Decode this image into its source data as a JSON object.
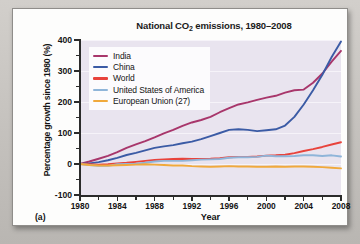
{
  "figure": {
    "panel_label": "(a)"
  },
  "chart_data": {
    "type": "line",
    "title": "National CO2 emissions, 1980–2008",
    "title_prefix": "National CO",
    "title_subscript": "2",
    "title_suffix": " emissions, 1980–2008",
    "xlabel": "Year",
    "ylabel": "Percentage growth since 1980 (%)",
    "xlim": [
      1980,
      2008
    ],
    "ylim": [
      -100,
      400
    ],
    "xticks": [
      1980,
      1984,
      1988,
      1992,
      1996,
      2000,
      2004,
      2008
    ],
    "xtick_labels": [
      "1980",
      "1984",
      "1988",
      "1992",
      "1996",
      "2000",
      "2004",
      "2008"
    ],
    "xticks_minor": [
      1982,
      1986,
      1990,
      1994,
      1998,
      2002,
      2006
    ],
    "yticks": [
      -100,
      0,
      100,
      200,
      300,
      400
    ],
    "ytick_labels": [
      "-100",
      "0",
      "100",
      "200",
      "300",
      "400"
    ],
    "yticks_minor": [
      -50,
      50,
      150,
      250,
      350
    ],
    "grid": true,
    "grid_axis": "y",
    "legend_position": "upper-left",
    "plot_background": "#e9e4ef",
    "x": [
      1980,
      1981,
      1982,
      1983,
      1984,
      1985,
      1986,
      1987,
      1988,
      1989,
      1990,
      1991,
      1992,
      1993,
      1994,
      1995,
      1996,
      1997,
      1998,
      1999,
      2000,
      2001,
      2002,
      2003,
      2004,
      2005,
      2006,
      2007,
      2008
    ],
    "series": [
      {
        "name": "India",
        "color": "#a8366b",
        "values": [
          0,
          8,
          17,
          26,
          38,
          52,
          63,
          74,
          86,
          99,
          110,
          123,
          134,
          142,
          152,
          167,
          180,
          192,
          199,
          207,
          214,
          220,
          230,
          238,
          240,
          262,
          292,
          330,
          365
        ]
      },
      {
        "name": "China",
        "color": "#3b5ba5",
        "values": [
          0,
          2,
          6,
          12,
          20,
          29,
          36,
          44,
          52,
          57,
          61,
          67,
          72,
          80,
          90,
          100,
          110,
          112,
          110,
          106,
          109,
          112,
          124,
          152,
          192,
          238,
          288,
          345,
          395
        ]
      },
      {
        "name": "World",
        "color": "#e8433c",
        "values": [
          0,
          -1,
          -2,
          -1,
          2,
          4,
          7,
          10,
          13,
          15,
          16,
          17,
          16,
          16,
          17,
          19,
          22,
          23,
          23,
          24,
          27,
          28,
          30,
          35,
          42,
          48,
          55,
          63,
          70
        ]
      },
      {
        "name": "United States of America",
        "color": "#8fb5d9",
        "values": [
          0,
          -3,
          -6,
          -6,
          -1,
          0,
          1,
          4,
          8,
          10,
          10,
          10,
          12,
          14,
          15,
          16,
          20,
          22,
          22,
          23,
          27,
          25,
          25,
          26,
          28,
          28,
          26,
          28,
          24
        ]
      },
      {
        "name": "European Union (27)",
        "color": "#f0a93c",
        "values": [
          0,
          -3,
          -5,
          -5,
          -4,
          -3,
          -2,
          -1,
          -2,
          -3,
          -5,
          -5,
          -7,
          -8,
          -9,
          -8,
          -7,
          -8,
          -8,
          -9,
          -9,
          -8,
          -9,
          -8,
          -8,
          -9,
          -10,
          -12,
          -14
        ]
      }
    ]
  },
  "legend": {
    "items": [
      {
        "label": "India",
        "color": "#a8366b"
      },
      {
        "label": "China",
        "color": "#3b5ba5"
      },
      {
        "label": "World",
        "color": "#e8433c"
      },
      {
        "label": "United States of America",
        "color": "#8fb5d9"
      },
      {
        "label": "European Union (27)",
        "color": "#f0a93c"
      }
    ]
  }
}
